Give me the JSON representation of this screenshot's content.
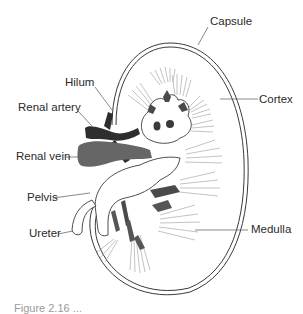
{
  "diagram": {
    "labels": {
      "capsule": "Capsule",
      "hilum": "Hilum",
      "cortex": "Cortex",
      "renal_artery": "Renal artery",
      "renal_vein": "Renal vein",
      "pelvis": "Pelvis",
      "ureter": "Ureter",
      "medulla": "Medulla"
    },
    "caption": "Figure 2.16 ..."
  },
  "colors": {
    "outline": "#3a3a3a",
    "vessel_dark": "#2e2e2e",
    "vessel_mid": "#555555",
    "vein": "#666666",
    "rays": "#9a9a9a",
    "text": "#2a2a2a"
  }
}
